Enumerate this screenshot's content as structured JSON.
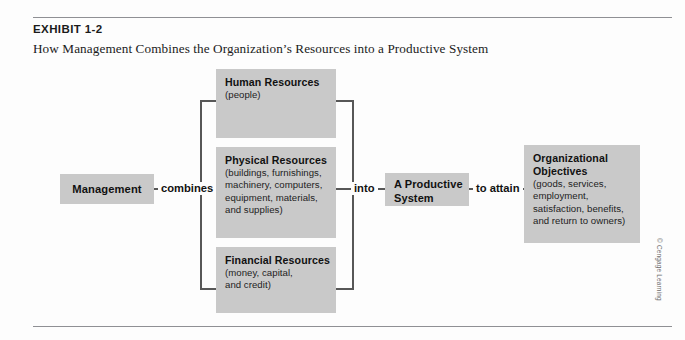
{
  "exhibit": {
    "label": "EXHIBIT 1-2",
    "title": "How Management Combines the Organization’s Resources into a Productive System"
  },
  "diagram": {
    "management": {
      "title": "Management"
    },
    "connectors": {
      "combines": "combines",
      "into": "into",
      "to_attain": "to attain"
    },
    "resources": [
      {
        "name": "human-resources",
        "title": "Human Resources",
        "detail": "(people)"
      },
      {
        "name": "physical-resources",
        "title": "Physical Resources",
        "detail": "(buildings, furnishings,\nmachinery, computers,\nequipment, materials,\nand supplies)"
      },
      {
        "name": "financial-resources",
        "title": "Financial Resources",
        "detail": "(money, capital,\nand credit)"
      }
    ],
    "productive_system": {
      "title": "A Productive\nSystem"
    },
    "objectives": {
      "title": "Organizational\nObjectives",
      "detail": "(goods, services,\nemployment,\nsatisfaction, benefits,\nand return to owners)"
    }
  },
  "credit": "© Cengage Learning",
  "colors": {
    "box_fill": "#c9c9c9",
    "line": "#575757",
    "rule": "#8f9094",
    "text": "#111111",
    "page": "#fdfdfd"
  }
}
